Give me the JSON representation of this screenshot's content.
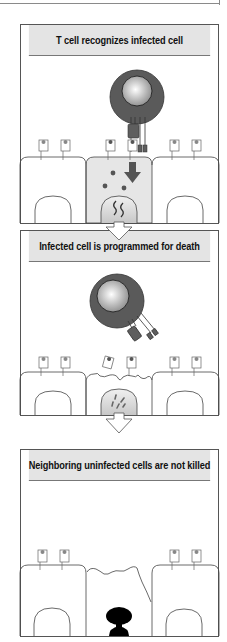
{
  "figure": {
    "panels": [
      {
        "id": "panel-1",
        "header": "T cell recognizes infected cell",
        "elements": [
          "t-cell",
          "tcr-receptor",
          "cd8-coreceptor",
          "mhc-peptide-complexes",
          "infected-cell",
          "granules",
          "down-arrow",
          "viral-nucleic-acid"
        ]
      },
      {
        "id": "panel-2",
        "header": "Infected cell is programmed for death",
        "elements": [
          "detached-t-cell",
          "damaged-membrane",
          "fragmenting-nucleus"
        ]
      },
      {
        "id": "panel-3",
        "header": "Neighboring uninfected cells are not killed",
        "elements": [
          "intact-neighbor-cells",
          "apoptotic-cell-remnant",
          "condensed-nucleus"
        ]
      }
    ],
    "colors": {
      "header_bg": "#e4e4e4",
      "infected_cell_fill": "#e6e6e6",
      "t_cell_outer": "#5a5a5a",
      "receptor_fill": "#5e5e5e",
      "outline": "#444444",
      "nucleus_dark": "#000000"
    }
  }
}
